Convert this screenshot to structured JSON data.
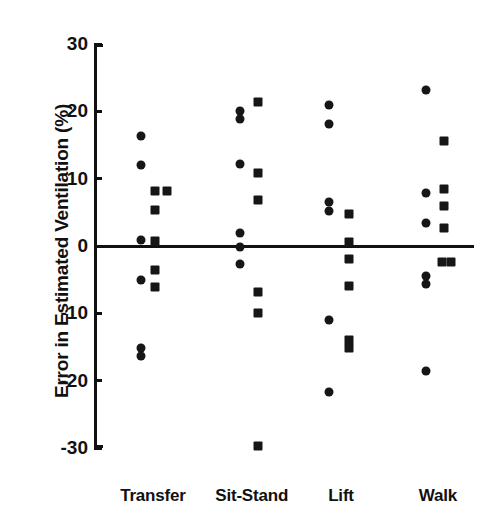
{
  "chart_data": {
    "type": "scatter",
    "title": "",
    "xlabel": "",
    "ylabel": "Error in Estimated Ventilation (%)",
    "ylim": [
      -30,
      30
    ],
    "yticks": [
      30,
      20,
      10,
      0,
      -10,
      -20,
      -30
    ],
    "ytick_labels": [
      "30",
      "20",
      "10",
      "0",
      "-10",
      "-20",
      "-30"
    ],
    "grid": false,
    "legend": "none",
    "zero_reference_line": 0,
    "categories": [
      "Transfer",
      "Sit-Stand",
      "Lift",
      "Walk"
    ],
    "marker_shapes": [
      "circle",
      "square"
    ],
    "series": [
      {
        "name": "circle",
        "marker": "circle",
        "points": [
          {
            "category": "Transfer",
            "x_offset": -0.18,
            "value": 16.4
          },
          {
            "category": "Transfer",
            "x_offset": -0.18,
            "value": 12.0
          },
          {
            "category": "Transfer",
            "x_offset": -0.18,
            "value": 0.9
          },
          {
            "category": "Transfer",
            "x_offset": -0.18,
            "value": -5.0
          },
          {
            "category": "Transfer",
            "x_offset": -0.18,
            "value": -15.2
          },
          {
            "category": "Transfer",
            "x_offset": -0.18,
            "value": -16.3
          },
          {
            "category": "Sit-Stand",
            "x_offset": -0.18,
            "value": 20.1
          },
          {
            "category": "Sit-Stand",
            "x_offset": -0.18,
            "value": 18.9
          },
          {
            "category": "Sit-Stand",
            "x_offset": -0.18,
            "value": 12.2
          },
          {
            "category": "Sit-Stand",
            "x_offset": -0.18,
            "value": 2.0
          },
          {
            "category": "Sit-Stand",
            "x_offset": -0.18,
            "value": -0.2
          },
          {
            "category": "Sit-Stand",
            "x_offset": -0.18,
            "value": -2.7
          },
          {
            "category": "Lift",
            "x_offset": -0.18,
            "value": 21.0
          },
          {
            "category": "Lift",
            "x_offset": -0.18,
            "value": 18.1
          },
          {
            "category": "Lift",
            "x_offset": -0.18,
            "value": 6.6
          },
          {
            "category": "Lift",
            "x_offset": -0.18,
            "value": 5.2
          },
          {
            "category": "Lift",
            "x_offset": -0.18,
            "value": -11.0
          },
          {
            "category": "Lift",
            "x_offset": -0.18,
            "value": -21.7
          },
          {
            "category": "Walk",
            "x_offset": -0.18,
            "value": 23.2
          },
          {
            "category": "Walk",
            "x_offset": -0.18,
            "value": 7.8
          },
          {
            "category": "Walk",
            "x_offset": -0.18,
            "value": 3.4
          },
          {
            "category": "Walk",
            "x_offset": -0.18,
            "value": -4.5
          },
          {
            "category": "Walk",
            "x_offset": -0.18,
            "value": -5.6
          },
          {
            "category": "Walk",
            "x_offset": -0.18,
            "value": -18.6
          }
        ]
      },
      {
        "name": "square",
        "marker": "square",
        "points": [
          {
            "category": "Transfer",
            "x_offset": 0.04,
            "value": 8.1
          },
          {
            "category": "Transfer",
            "x_offset": 0.22,
            "value": 8.1
          },
          {
            "category": "Transfer",
            "x_offset": 0.04,
            "value": 5.4
          },
          {
            "category": "Transfer",
            "x_offset": 0.04,
            "value": 0.7
          },
          {
            "category": "Transfer",
            "x_offset": 0.04,
            "value": -3.6
          },
          {
            "category": "Transfer",
            "x_offset": 0.04,
            "value": -6.1
          },
          {
            "category": "Sit-Stand",
            "x_offset": 0.1,
            "value": 21.4
          },
          {
            "category": "Sit-Stand",
            "x_offset": 0.1,
            "value": 10.8
          },
          {
            "category": "Sit-Stand",
            "x_offset": 0.1,
            "value": 6.8
          },
          {
            "category": "Sit-Stand",
            "x_offset": 0.1,
            "value": -6.9
          },
          {
            "category": "Sit-Stand",
            "x_offset": 0.1,
            "value": -9.9
          },
          {
            "category": "Sit-Stand",
            "x_offset": 0.1,
            "value": -29.7
          },
          {
            "category": "Lift",
            "x_offset": 0.12,
            "value": 4.8
          },
          {
            "category": "Lift",
            "x_offset": 0.12,
            "value": 0.6
          },
          {
            "category": "Lift",
            "x_offset": 0.12,
            "value": -1.9
          },
          {
            "category": "Lift",
            "x_offset": 0.12,
            "value": -5.9
          },
          {
            "category": "Lift",
            "x_offset": 0.12,
            "value": -13.9
          },
          {
            "category": "Lift",
            "x_offset": 0.12,
            "value": -15.1
          },
          {
            "category": "Walk",
            "x_offset": 0.1,
            "value": 15.6
          },
          {
            "category": "Walk",
            "x_offset": 0.1,
            "value": 8.5
          },
          {
            "category": "Walk",
            "x_offset": 0.1,
            "value": 6.0
          },
          {
            "category": "Walk",
            "x_offset": 0.1,
            "value": 2.6
          },
          {
            "category": "Walk",
            "x_offset": 0.06,
            "value": -2.4
          },
          {
            "category": "Walk",
            "x_offset": 0.2,
            "value": -2.4
          }
        ]
      }
    ]
  }
}
